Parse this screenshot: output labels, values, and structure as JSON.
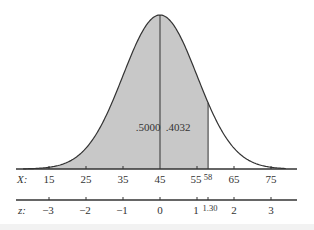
{
  "chart_data": {
    "type": "area",
    "title": "",
    "mean": 45,
    "sd": 10,
    "x_axis": {
      "label": "X:",
      "ticks": [
        15,
        25,
        35,
        45,
        55,
        65,
        75
      ],
      "tick_labels": [
        "15",
        "25",
        "35",
        "45",
        "55",
        "65",
        "75"
      ],
      "marker": {
        "value": 58,
        "label": "58"
      }
    },
    "z_axis": {
      "label": "z:",
      "ticks": [
        -3,
        -2,
        -1,
        0,
        1,
        2,
        3
      ],
      "tick_labels": [
        "−3",
        "−2",
        "−1",
        "0",
        "1",
        "2",
        "3"
      ],
      "marker": {
        "value": 1.3,
        "label": "1.30"
      }
    },
    "shaded_regions": [
      {
        "from": "-inf",
        "to": 45,
        "area": 0.5,
        "label": ".5000"
      },
      {
        "from": 45,
        "to": 58,
        "area": 0.4032,
        "label": ".4032"
      }
    ],
    "colors": {
      "shade": "#c8c8c8",
      "curve": "#333333",
      "axis": "#333333"
    },
    "grid": false,
    "legend": "none"
  },
  "labels": {
    "left_area": ".5000",
    "right_area": ".4032",
    "x_name": "X:",
    "z_name": "z:",
    "x_ticks": [
      "15",
      "25",
      "35",
      "45",
      "55",
      "65",
      "75"
    ],
    "x_marker": "58",
    "z_ticks": [
      "−3",
      "−2",
      "−1",
      "0",
      "1",
      "2",
      "3"
    ],
    "z_marker": "1.30"
  }
}
